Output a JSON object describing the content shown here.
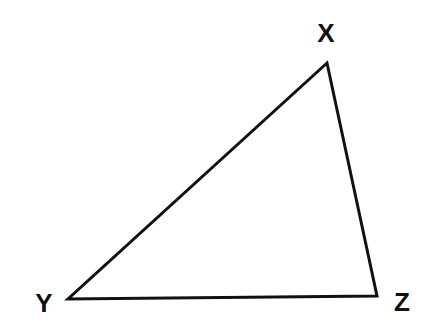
{
  "diagram": {
    "type": "triangle",
    "stroke_color": "#111111",
    "background": "#ffffff",
    "vertices": [
      {
        "name": "X",
        "x": 327,
        "y": 63,
        "label_x": 326,
        "label_y": 42
      },
      {
        "name": "Y",
        "x": 68,
        "y": 299,
        "label_x": 44,
        "label_y": 312
      },
      {
        "name": "Z",
        "x": 377,
        "y": 296,
        "label_x": 402,
        "label_y": 311
      }
    ],
    "labels": {
      "x": "X",
      "y": "Y",
      "z": "Z"
    }
  }
}
